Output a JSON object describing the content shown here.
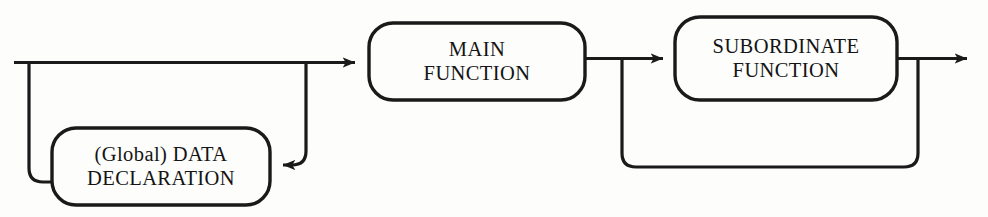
{
  "diagram": {
    "type": "railroad-flow-diagram",
    "background_color": "#fdfdfc",
    "line_color": "#1a1a1a",
    "text_color": "#141414",
    "nodes": [
      {
        "id": "main_function",
        "line_1": "MAIN",
        "line_2": "FUNCTION",
        "shape": "rounded-rectangle"
      },
      {
        "id": "subordinate_function",
        "line_1": "SUBORDINATE",
        "line_2": "FUNCTION",
        "shape": "rounded-rectangle"
      },
      {
        "id": "data_declaration",
        "line_1": "(Global) DATA",
        "line_2": "DECLARATION",
        "shape": "rounded-rectangle"
      }
    ],
    "connectors": [
      {
        "id": "entry-line",
        "kind": "line",
        "direction": "right"
      },
      {
        "id": "data-declaration-loop",
        "kind": "loop",
        "direction": "left"
      },
      {
        "id": "main-to-subordinate",
        "kind": "arrow",
        "direction": "right"
      },
      {
        "id": "subordinate-loop",
        "kind": "loop",
        "direction": "left"
      },
      {
        "id": "exit-arrow",
        "kind": "arrow",
        "direction": "right"
      }
    ]
  }
}
